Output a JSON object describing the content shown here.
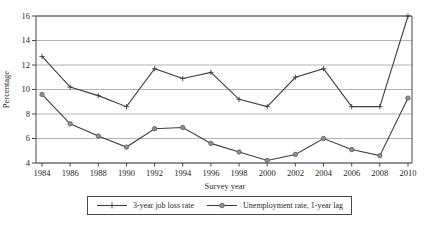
{
  "figure": {
    "background": "#ffffff"
  },
  "chart_data": {
    "type": "line",
    "title": "",
    "xlabel": "Survey year",
    "ylabel": "Percentage",
    "categories": [
      "1984",
      "1986",
      "1988",
      "1990",
      "1992",
      "1994",
      "1996",
      "1998",
      "2000",
      "2002",
      "2004",
      "2006",
      "2008",
      "2010"
    ],
    "ylim": [
      4,
      16
    ],
    "yticks": [
      4,
      6,
      8,
      10,
      12,
      14,
      16
    ],
    "grid": true,
    "legend_position": "bottom-center-boxed",
    "axis_color": "#4a4a4a",
    "grid_color": "#9b9b9b",
    "text_color": "#1f1f1f",
    "series": [
      {
        "name": "3-year job loss rate",
        "marker": "plus",
        "line_color": "#3f3f3f",
        "values": [
          12.7,
          10.2,
          9.5,
          8.6,
          11.7,
          10.9,
          11.4,
          9.2,
          8.6,
          11.0,
          11.7,
          8.6,
          8.6,
          16.0
        ]
      },
      {
        "name": "Unemployment rate, 1-year lag",
        "marker": "filled-circle",
        "line_color": "#3f3f3f",
        "marker_fill": "#8f8f8f",
        "marker_stroke": "#5c5c5c",
        "values": [
          9.6,
          7.2,
          6.2,
          5.3,
          6.8,
          6.9,
          5.6,
          4.9,
          4.2,
          4.7,
          6.0,
          5.1,
          4.6,
          9.3
        ]
      }
    ]
  }
}
